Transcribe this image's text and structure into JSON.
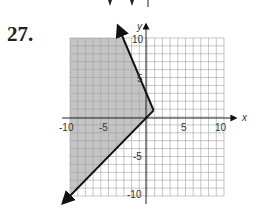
{
  "problem": {
    "number": "27."
  },
  "chart_data": {
    "type": "line",
    "title": "",
    "xlabel": "x",
    "ylabel": "y",
    "xlim": [
      -10,
      10
    ],
    "ylim": [
      -10,
      10
    ],
    "grid": true,
    "x_ticks": [
      "-10",
      "-5",
      "5",
      "10"
    ],
    "y_ticks": [
      "10",
      "5",
      "-5",
      "-10"
    ],
    "series": [
      {
        "name": "boundary-upper",
        "points": [
          [
            1,
            1
          ],
          [
            -3.5,
            11
          ]
        ],
        "style": "solid",
        "arrow": "end"
      },
      {
        "name": "boundary-lower",
        "points": [
          [
            1,
            1
          ],
          [
            -11,
            -11
          ]
        ],
        "style": "solid",
        "arrow": "end"
      }
    ],
    "shaded_region": {
      "description": "Region left of both boundary rays (x-negative side)",
      "color": "#bdbdbd"
    }
  },
  "colors": {
    "shade": "#bdbdbd",
    "grid": "#9a9a9a",
    "line": "#111111"
  },
  "top_fragment": {
    "description": "cropped arrows of previous problem"
  }
}
